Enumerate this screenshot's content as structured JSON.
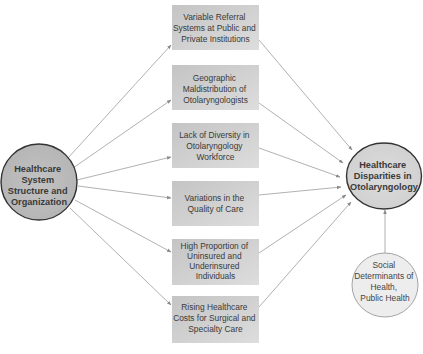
{
  "diagram": {
    "source_node": {
      "lines": [
        "Healthcare",
        "System",
        "Structure and",
        "Organization"
      ]
    },
    "target_node": {
      "lines": [
        "Healthcare",
        "Disparities in",
        "Otolaryngology"
      ]
    },
    "external_node": {
      "lines": [
        "Social",
        "Determinants of",
        "Health,",
        "Public Health"
      ]
    },
    "factors": [
      {
        "lines": [
          "Variable Referral",
          "Systems at Public and",
          "Private Institutions"
        ]
      },
      {
        "lines": [
          "Geographic",
          "Maldistribution of",
          "Otolaryngologists"
        ]
      },
      {
        "lines": [
          "Lack of Diversity in",
          "Otolaryngology",
          "Workforce"
        ]
      },
      {
        "lines": [
          "Variations in the",
          "Quality of Care"
        ]
      },
      {
        "lines": [
          "High Proportion of",
          "Uninsured and",
          "Underinsured",
          "Individuals"
        ]
      },
      {
        "lines": [
          "Rising Healthcare",
          "Costs for Surgical and",
          "Specialty Care"
        ]
      }
    ],
    "edges": [
      {
        "from": "Healthcare System Structure and Organization",
        "to": "Variable Referral Systems at Public and Private Institutions"
      },
      {
        "from": "Healthcare System Structure and Organization",
        "to": "Geographic Maldistribution of Otolaryngologists"
      },
      {
        "from": "Healthcare System Structure and Organization",
        "to": "Lack of Diversity in Otolaryngology Workforce"
      },
      {
        "from": "Healthcare System Structure and Organization",
        "to": "Variations in the Quality of Care"
      },
      {
        "from": "Healthcare System Structure and Organization",
        "to": "High Proportion of Uninsured and Underinsured Individuals"
      },
      {
        "from": "Healthcare System Structure and Organization",
        "to": "Rising Healthcare Costs for Surgical and Specialty Care"
      },
      {
        "from": "Variable Referral Systems at Public and Private Institutions",
        "to": "Healthcare Disparities in Otolaryngology"
      },
      {
        "from": "Geographic Maldistribution of Otolaryngologists",
        "to": "Healthcare Disparities in Otolaryngology"
      },
      {
        "from": "Lack of Diversity in Otolaryngology Workforce",
        "to": "Healthcare Disparities in Otolaryngology"
      },
      {
        "from": "Variations in the Quality of Care",
        "to": "Healthcare Disparities in Otolaryngology"
      },
      {
        "from": "High Proportion of Uninsured and Underinsured Individuals",
        "to": "Healthcare Disparities in Otolaryngology"
      },
      {
        "from": "Rising Healthcare Costs for Surgical and Specialty Care",
        "to": "Healthcare Disparities in Otolaryngology"
      },
      {
        "from": "Social Determinants of Health, Public Health",
        "to": "Healthcare Disparities in Otolaryngology"
      }
    ],
    "colors": {
      "source_fill": "#bdbdbd",
      "target_fill": "#d6d6d6",
      "external_fill": "#ededed",
      "box_fill": "#cfcfcf",
      "edge": "#a8a8a8",
      "node_border": "#333333"
    }
  }
}
